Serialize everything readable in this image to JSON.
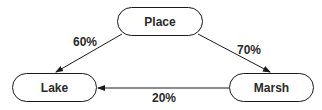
{
  "diagram": {
    "nodes": [
      {
        "id": "place",
        "label": "Place"
      },
      {
        "id": "lake",
        "label": "Lake"
      },
      {
        "id": "marsh",
        "label": "Marsh"
      }
    ],
    "edges": [
      {
        "from": "place",
        "to": "lake",
        "label": "60%"
      },
      {
        "from": "place",
        "to": "marsh",
        "label": "70%"
      },
      {
        "from": "marsh",
        "to": "lake",
        "label": "20%"
      }
    ]
  },
  "colors": {
    "stroke": "#1a1a1a",
    "text": "#2a2a2a"
  }
}
